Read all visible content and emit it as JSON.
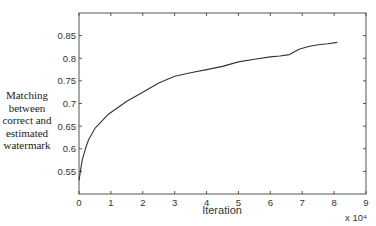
{
  "chart_data": {
    "type": "line",
    "title": "",
    "xlabel": "Iteration",
    "ylabel": "Matching between correct and estimated watermark",
    "x_multiplier_label": "x 10⁴",
    "xlim": [
      0,
      9
    ],
    "ylim": [
      0.5,
      0.9
    ],
    "x_ticks": [
      "0",
      "1",
      "2",
      "3",
      "4",
      "5",
      "6",
      "7",
      "8",
      "9"
    ],
    "y_ticks": [
      "0.55",
      "0.6",
      "0.65",
      "0.7",
      "0.75",
      "0.8",
      "0.85"
    ],
    "grid": false,
    "legend": null,
    "series": [
      {
        "name": "matching",
        "color": "#333333",
        "x": [
          0,
          0.1,
          0.2,
          0.3,
          0.5,
          0.7,
          0.9,
          1.2,
          1.5,
          2.0,
          2.5,
          3.0,
          3.5,
          4.0,
          4.5,
          5.0,
          5.5,
          6.0,
          6.3,
          6.6,
          6.9,
          7.2,
          7.5,
          7.8,
          8.1
        ],
        "y": [
          0.53,
          0.575,
          0.6,
          0.62,
          0.645,
          0.66,
          0.675,
          0.69,
          0.705,
          0.725,
          0.745,
          0.76,
          0.768,
          0.775,
          0.782,
          0.792,
          0.798,
          0.803,
          0.805,
          0.808,
          0.82,
          0.826,
          0.83,
          0.832,
          0.835
        ]
      }
    ]
  },
  "labels": {
    "ylabel_lines": [
      "Matching",
      "between",
      "correct and",
      "estimated",
      "watermark"
    ],
    "xlabel": "Iteration",
    "x_multiplier": "x 10⁴"
  }
}
